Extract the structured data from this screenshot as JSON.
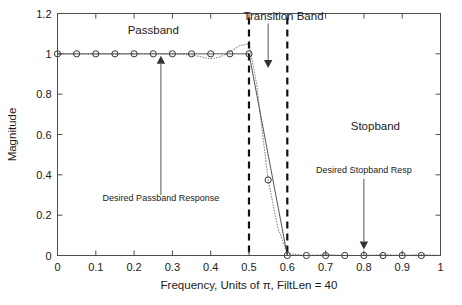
{
  "chart_data": {
    "type": "line",
    "title": "",
    "xlabel": "Frequency, Units of π, FiltLen = 40",
    "ylabel": "Magnitude",
    "xlim": [
      0,
      1
    ],
    "ylim": [
      0,
      1.2
    ],
    "grid": false,
    "legend_position": "none",
    "xticks": [
      "0",
      "0.1",
      "0.2",
      "0.3",
      "0.4",
      "0.5",
      "0.6",
      "0.7",
      "0.8",
      "0.9",
      "1"
    ],
    "xtick_values": [
      0,
      0.1,
      0.2,
      0.3,
      0.4,
      0.5,
      0.6,
      0.7,
      0.8,
      0.9,
      1
    ],
    "yticks": [
      "0",
      "0.2",
      "0.4",
      "0.6",
      "0.8",
      "1",
      "1.2"
    ],
    "ytick_values": [
      0,
      0.2,
      0.4,
      0.6,
      0.8,
      1,
      1.2
    ],
    "series": [
      {
        "name": "Desired Response",
        "style": "solid-with-circle-markers",
        "x": [
          0,
          0.05,
          0.1,
          0.15,
          0.2,
          0.25,
          0.3,
          0.35,
          0.4,
          0.45,
          0.5,
          0.6,
          0.65,
          0.7,
          0.75,
          0.8,
          0.85,
          0.9,
          0.95,
          1
        ],
        "y": [
          1,
          1,
          1,
          1,
          1,
          1,
          1,
          1,
          1,
          1,
          1,
          0,
          0,
          0,
          0,
          0,
          0,
          0,
          0,
          0
        ]
      },
      {
        "name": "Actual Filter Response",
        "style": "dotted",
        "x": [
          0,
          0.05,
          0.1,
          0.15,
          0.2,
          0.25,
          0.3,
          0.35,
          0.4,
          0.425,
          0.45,
          0.475,
          0.5,
          0.52,
          0.55,
          0.575,
          0.6,
          0.65,
          0.7,
          0.75,
          0.8,
          0.85,
          0.9,
          0.95,
          1
        ],
        "y": [
          1.0,
          1.0,
          1.0,
          1.0,
          1.0,
          1.0,
          1.0,
          0.995,
          0.975,
          0.985,
          1.01,
          1.04,
          1.05,
          0.85,
          0.375,
          0.14,
          0.01,
          0.0,
          0.005,
          0.0,
          0.0,
          0.005,
          0.0,
          0.005,
          0.0
        ]
      }
    ],
    "markers": {
      "passband_x": [
        0,
        0.05,
        0.1,
        0.15,
        0.2,
        0.25,
        0.3,
        0.35,
        0.4,
        0.45,
        0.5
      ],
      "passband_y": 1,
      "midband_x": [
        0.55
      ],
      "midband_y": [
        0.375
      ],
      "stopband_x": [
        0.6,
        0.65,
        0.7,
        0.75,
        0.8,
        0.85,
        0.9,
        0.95
      ],
      "stopband_y": 0
    },
    "vertical_band_edges": [
      0.5,
      0.6
    ],
    "annotations": [
      {
        "id": "passband",
        "text": "Passband",
        "x": 0.25,
        "y": 1.1
      },
      {
        "id": "transition_band",
        "text": "Transition Band",
        "x": 0.59,
        "y": 1.17
      },
      {
        "id": "stopband",
        "text": "Stopband",
        "x": 0.83,
        "y": 0.62
      },
      {
        "id": "desired_passband_response",
        "text": "Desired Passband Response",
        "x": 0.27,
        "y": 0.27
      },
      {
        "id": "desired_stopband_resp",
        "text": "Desired Stopband Resp",
        "x": 0.8,
        "y": 0.41
      }
    ],
    "arrows": [
      {
        "id": "passband-arrow",
        "from_x": 0.27,
        "from_y": 0.3,
        "to_x": 0.27,
        "to_y": 0.99,
        "direction": "up"
      },
      {
        "id": "transition-band-arrow",
        "from_x": 0.55,
        "from_y": 1.15,
        "to_x": 0.55,
        "to_y": 0.93,
        "direction": "down"
      },
      {
        "id": "stopband-arrow",
        "from_x": 0.8,
        "from_y": 0.38,
        "to_x": 0.8,
        "to_y": 0.03,
        "direction": "down"
      }
    ]
  },
  "figure": {
    "background_color": "#ffffff",
    "axis_color": "#4d4d4d",
    "desired_color": "#555555",
    "actual_color": "#8c8c8c",
    "band_edge_color": "#111111"
  }
}
